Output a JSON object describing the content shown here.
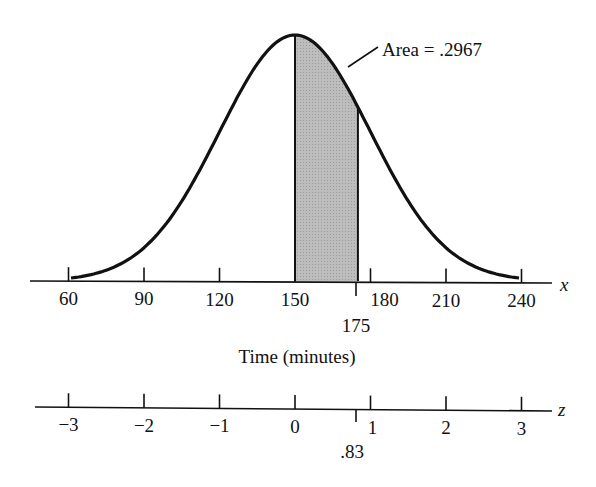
{
  "chart_data": {
    "type": "area",
    "title": "",
    "mean": 150,
    "std_dev": 30,
    "shaded_region": {
      "from": 150,
      "to": 175,
      "area": 0.2967
    },
    "annotation": "Area = .2967",
    "x_axis": {
      "variable": "x",
      "label": "Time (minutes)",
      "ticks": [
        60,
        90,
        120,
        150,
        180,
        210,
        240
      ],
      "tick_labels": [
        "60",
        "90",
        "120",
        "150",
        "180",
        "210",
        "240"
      ],
      "marked_value": "175",
      "range": [
        60,
        240
      ]
    },
    "z_axis": {
      "variable": "z",
      "ticks": [
        -3,
        -2,
        -1,
        0,
        1,
        2,
        3
      ],
      "tick_labels": [
        "−3",
        "−2",
        "−1",
        "0",
        "1",
        "2",
        "3"
      ],
      "marked_value": ".83"
    },
    "grid": false,
    "legend": null,
    "colors": {
      "curve": "#111111",
      "shade": "#b8b8b8"
    }
  }
}
